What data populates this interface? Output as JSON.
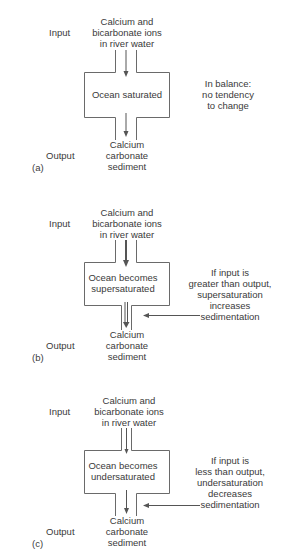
{
  "panels": [
    {
      "id": "a",
      "label": "(a)",
      "input_label": "Input",
      "output_label": "Output",
      "input_text": [
        "Calcium and",
        "bicarbonate ions",
        "in river water"
      ],
      "ocean_text": [
        "Ocean saturated"
      ],
      "output_text": [
        "Calcium",
        "carbonate",
        "sediment"
      ],
      "note_text": [
        "In balance:",
        "no tendency",
        "to change"
      ],
      "input_channel": "equal",
      "output_channel": "equal"
    },
    {
      "id": "b",
      "label": "(b)",
      "input_label": "Input",
      "output_label": "Output",
      "input_text": [
        "Calcium and",
        "bicarbonate ions",
        "in river water"
      ],
      "ocean_text": [
        "Ocean becomes",
        "supersaturated"
      ],
      "output_text": [
        "Calcium",
        "carbonate",
        "sediment"
      ],
      "note_text": [
        "If input is",
        "greater than output,",
        "supersaturation",
        "increases",
        "sedimentation"
      ],
      "input_channel": "wide",
      "output_channel": "narrow"
    },
    {
      "id": "c",
      "label": "(c)",
      "input_label": "Input",
      "output_label": "Output",
      "input_text": [
        "Calcium and",
        "bicarbonate ions",
        "in river water"
      ],
      "ocean_text": [
        "Ocean becomes",
        "undersaturated"
      ],
      "output_text": [
        "Calcium",
        "carbonate",
        "sediment"
      ],
      "note_text": [
        "If input is",
        "less than output,",
        "undersaturation",
        "decreases",
        "sedimentation"
      ],
      "input_channel": "narrow",
      "output_channel": "wide"
    }
  ]
}
